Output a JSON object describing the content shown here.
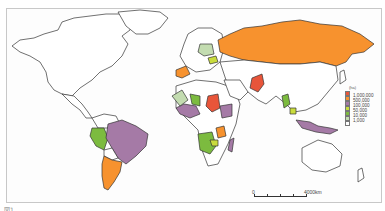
{
  "map": {
    "legend": {
      "unit": "(ha)",
      "items": [
        {
          "label": "1,000,000",
          "color": "#e8553a"
        },
        {
          "label": "500,000",
          "color": "#f7922e"
        },
        {
          "label": "100,000",
          "color": "#a57aa6"
        },
        {
          "label": "50,000",
          "color": "#c9dc3c"
        },
        {
          "label": "10,000",
          "color": "#7cbb3f"
        },
        {
          "label": "1,000",
          "color": "#c3dcb0"
        },
        {
          "label": "",
          "color": "#ffffff"
        }
      ]
    },
    "scale_bar": {
      "start": "0",
      "end": "4000km"
    },
    "regions": [
      {
        "name": "Russia",
        "class": "500,000"
      },
      {
        "name": "Brazil",
        "class": "100,000"
      },
      {
        "name": "Argentina",
        "class": "500,000"
      },
      {
        "name": "Peru",
        "class": "10,000"
      },
      {
        "name": "Sudan",
        "class": "1,000,000"
      },
      {
        "name": "Pakistan",
        "class": "1,000,000"
      },
      {
        "name": "Indonesia",
        "class": "100,000"
      },
      {
        "name": "Myanmar",
        "class": "10,000"
      },
      {
        "name": "Madagascar",
        "class": "100,000"
      }
    ],
    "caption": "図1 …"
  }
}
